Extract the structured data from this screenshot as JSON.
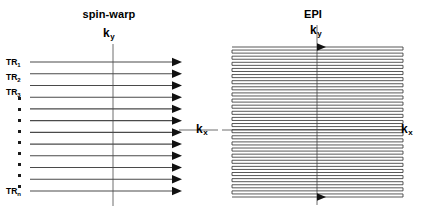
{
  "figure": {
    "width": 436,
    "height": 221,
    "background_color": "#ffffff",
    "line_color": "#3a3a3a",
    "axis_color": "#6e6e6e",
    "arrow_color": "#111111"
  },
  "panels": [
    {
      "id": "spin-warp",
      "title": "spin-warp",
      "axes": {
        "vertical_label": "k",
        "vertical_subscript": "y",
        "horizontal_label": "k",
        "horizontal_subscript": "x"
      },
      "trajectory": {
        "type": "line",
        "description": "twelve separate horizontal lines, each acquired in one TR, all traversed left to right",
        "line_count": 12,
        "direction": "left-to-right",
        "arrowheads": 12,
        "shots": "multi-shot"
      },
      "row_labels": [
        {
          "text": "TR",
          "subscript": "1",
          "row_index": 0
        },
        {
          "text": "TR",
          "subscript": "2",
          "row_index": 1
        },
        {
          "text": "TR",
          "subscript": "3",
          "row_index": 2
        },
        {
          "text": "TR",
          "subscript": "n",
          "row_index": 11
        }
      ],
      "ellipsis": {
        "dot_count": 9,
        "orientation": "vertical"
      }
    },
    {
      "id": "epi",
      "title": "EPI",
      "axes": {
        "vertical_label": "k",
        "vertical_subscript": "y",
        "horizontal_label": "k",
        "horizontal_subscript": "x"
      },
      "trajectory": {
        "type": "line",
        "description": "single continuous raster zigzag covering k-space in one shot, horizontal lines joined by short vertical blips at alternating edges",
        "line_count": 50,
        "direction": "alternating (boustrophedon)",
        "arrowheads": 2,
        "shots": "single-shot"
      }
    }
  ],
  "chart_data": {
    "type": "line",
    "title": "",
    "xlabel": "k_x",
    "ylabel": "k_y",
    "grid": false,
    "legend": "none",
    "series": [
      {
        "name": "spin-warp",
        "panel": "left",
        "line_count": 12,
        "sampling": "one horizontal k-space line per TR, all acquired left-to-right",
        "labels": [
          "TR_1",
          "TR_2",
          "TR_3",
          "TR_n"
        ]
      },
      {
        "name": "EPI",
        "panel": "right",
        "line_count": 50,
        "sampling": "continuous zigzag raster traversing all of k-space in a single shot"
      }
    ]
  }
}
